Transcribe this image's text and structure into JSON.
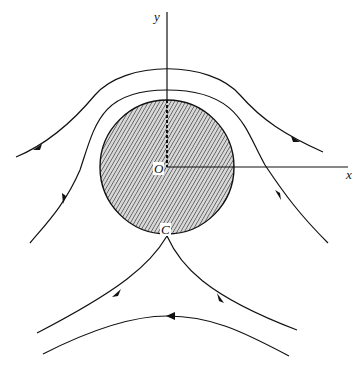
{
  "diagram": {
    "type": "flow streamlines around a circular obstacle",
    "axes": {
      "x_label": "x",
      "y_label": "y"
    },
    "points": {
      "origin_label": "O",
      "stagnation_label": "C"
    },
    "obstacle": {
      "shape": "circle",
      "fill": "hatched gray",
      "center_px": [
        167,
        167
      ],
      "radius_px": 67
    },
    "streamlines": [
      {
        "id": "upper-outer",
        "direction": "right-to-left"
      },
      {
        "id": "upper-inner",
        "direction": "right-to-left"
      },
      {
        "id": "left-upper",
        "direction": "downward"
      },
      {
        "id": "right-upper",
        "direction": "upward"
      },
      {
        "id": "lower-left-from-C",
        "direction": "away from C"
      },
      {
        "id": "lower-right-to-C",
        "direction": "toward C"
      },
      {
        "id": "bottom",
        "direction": "right-to-left"
      }
    ],
    "colors": {
      "line": "#111111",
      "fill": "#9a9a9a",
      "background": "#ffffff"
    }
  }
}
